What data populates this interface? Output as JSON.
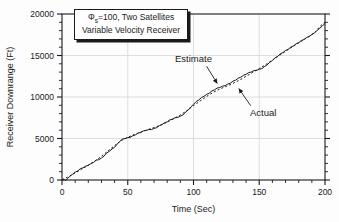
{
  "chart_data": {
    "type": "line",
    "title_box": {
      "line1_phi": "Φ",
      "line1_sub": "s",
      "line1_rest": "=100, Two Satellites",
      "line2": "Variable Velocity Receiver"
    },
    "xlabel": "Time (Sec)",
    "ylabel": "Receiver Downrange (Ft)",
    "xlim": [
      0,
      200
    ],
    "ylim": [
      0,
      20000
    ],
    "x_ticks": [
      0,
      50,
      100,
      150,
      200
    ],
    "y_ticks": [
      0,
      5000,
      10000,
      15000,
      20000
    ],
    "x_minor_step": 10,
    "y_minor_step": 1000,
    "grid": true,
    "legend_position": "inline-annotations",
    "colors": {
      "line": "#1a1a1a",
      "grid": "#d9d9d9",
      "background": "#fdfdfd"
    },
    "series": [
      {
        "name": "Estimate",
        "style": "solid",
        "points": [
          [
            0,
            0
          ],
          [
            2,
            40
          ],
          [
            3,
            -60
          ],
          [
            4,
            150
          ],
          [
            6,
            460
          ],
          [
            8,
            690
          ],
          [
            10,
            950
          ],
          [
            12,
            1100
          ],
          [
            14,
            1370
          ],
          [
            16,
            1460
          ],
          [
            18,
            1680
          ],
          [
            20,
            1760
          ],
          [
            22,
            1980
          ],
          [
            24,
            2120
          ],
          [
            26,
            2380
          ],
          [
            28,
            2450
          ],
          [
            30,
            2650
          ],
          [
            32,
            2880
          ],
          [
            34,
            3260
          ],
          [
            36,
            3450
          ],
          [
            38,
            3740
          ],
          [
            40,
            3940
          ],
          [
            42,
            4330
          ],
          [
            44,
            4660
          ],
          [
            46,
            4940
          ],
          [
            48,
            4990
          ],
          [
            50,
            5110
          ],
          [
            52,
            5140
          ],
          [
            54,
            5350
          ],
          [
            56,
            5450
          ],
          [
            58,
            5660
          ],
          [
            60,
            5740
          ],
          [
            62,
            5930
          ],
          [
            64,
            5960
          ],
          [
            66,
            6080
          ],
          [
            68,
            6070
          ],
          [
            70,
            6220
          ],
          [
            72,
            6300
          ],
          [
            74,
            6540
          ],
          [
            76,
            6660
          ],
          [
            78,
            6900
          ],
          [
            80,
            7000
          ],
          [
            82,
            7240
          ],
          [
            84,
            7340
          ],
          [
            86,
            7510
          ],
          [
            88,
            7530
          ],
          [
            90,
            7690
          ],
          [
            92,
            7840
          ],
          [
            94,
            8190
          ],
          [
            96,
            8430
          ],
          [
            98,
            8820
          ],
          [
            100,
            9110
          ],
          [
            102,
            9450
          ],
          [
            104,
            9640
          ],
          [
            106,
            9930
          ],
          [
            108,
            10080
          ],
          [
            110,
            10330
          ],
          [
            112,
            10470
          ],
          [
            114,
            10730
          ],
          [
            116,
            10850
          ],
          [
            118,
            11080
          ],
          [
            120,
            11140
          ],
          [
            122,
            11300
          ],
          [
            124,
            11360
          ],
          [
            126,
            11550
          ],
          [
            128,
            11660
          ],
          [
            130,
            11900
          ],
          [
            132,
            12020
          ],
          [
            134,
            12260
          ],
          [
            136,
            12380
          ],
          [
            138,
            12620
          ],
          [
            140,
            12730
          ],
          [
            142,
            12940
          ],
          [
            144,
            13010
          ],
          [
            146,
            13180
          ],
          [
            148,
            13210
          ],
          [
            150,
            13350
          ],
          [
            152,
            13420
          ],
          [
            154,
            13680
          ],
          [
            156,
            13870
          ],
          [
            158,
            14190
          ],
          [
            160,
            14390
          ],
          [
            162,
            14710
          ],
          [
            164,
            14900
          ],
          [
            166,
            15190
          ],
          [
            168,
            15350
          ],
          [
            170,
            15610
          ],
          [
            172,
            15750
          ],
          [
            174,
            16010
          ],
          [
            176,
            16150
          ],
          [
            178,
            16410
          ],
          [
            180,
            16550
          ],
          [
            182,
            16810
          ],
          [
            184,
            16930
          ],
          [
            186,
            17170
          ],
          [
            188,
            17290
          ],
          [
            190,
            17540
          ],
          [
            192,
            17710
          ],
          [
            194,
            18040
          ],
          [
            196,
            18260
          ],
          [
            198,
            18580
          ],
          [
            200,
            18840
          ]
        ]
      },
      {
        "name": "Actual",
        "style": "dotted",
        "points": [
          [
            0,
            50
          ],
          [
            5,
            400
          ],
          [
            10,
            850
          ],
          [
            15,
            1300
          ],
          [
            20,
            1800
          ],
          [
            25,
            2300
          ],
          [
            30,
            2850
          ],
          [
            35,
            3500
          ],
          [
            40,
            4150
          ],
          [
            45,
            4750
          ],
          [
            50,
            5150
          ],
          [
            55,
            5480
          ],
          [
            60,
            5780
          ],
          [
            65,
            6060
          ],
          [
            70,
            6320
          ],
          [
            75,
            6620
          ],
          [
            80,
            6980
          ],
          [
            85,
            7380
          ],
          [
            90,
            7830
          ],
          [
            95,
            8350
          ],
          [
            100,
            8950
          ],
          [
            105,
            9520
          ],
          [
            110,
            10070
          ],
          [
            115,
            10560
          ],
          [
            120,
            10960
          ],
          [
            125,
            11290
          ],
          [
            130,
            11640
          ],
          [
            135,
            12040
          ],
          [
            140,
            12490
          ],
          [
            145,
            12960
          ],
          [
            150,
            13430
          ],
          [
            155,
            13920
          ],
          [
            160,
            14440
          ],
          [
            165,
            14980
          ],
          [
            170,
            15520
          ],
          [
            175,
            16030
          ],
          [
            180,
            16520
          ],
          [
            185,
            17010
          ],
          [
            190,
            17530
          ],
          [
            193,
            17900
          ],
          [
            196,
            18480
          ],
          [
            198,
            18760
          ],
          [
            200,
            19000
          ]
        ]
      }
    ],
    "annotations": [
      {
        "label": "Estimate",
        "text_xy": [
          100,
          14600
        ],
        "arrow_from": [
          110,
          13700
        ],
        "arrow_to": [
          118,
          11650
        ]
      },
      {
        "label": "Actual",
        "text_xy": [
          153,
          8100
        ],
        "arrow_from": [
          143.5,
          8950
        ],
        "arrow_to": [
          134.5,
          11000
        ]
      }
    ]
  }
}
